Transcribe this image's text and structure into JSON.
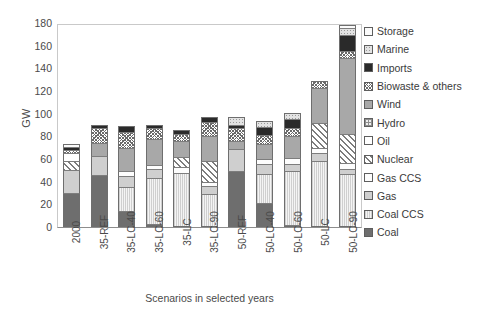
{
  "chart_data": {
    "type": "bar",
    "stacked": true,
    "title": "",
    "xlabel": "Scenarios in selected years",
    "ylabel": "GW",
    "ylim": [
      0,
      180
    ],
    "ytick_step": 20,
    "yticks": [
      180,
      160,
      140,
      120,
      100,
      80,
      60,
      40,
      20,
      0
    ],
    "grid": false,
    "legend_position": "right",
    "categories": [
      "2000",
      "35-REF",
      "35-LC-40",
      "35-LC-60",
      "35-LC",
      "35-LC-90",
      "50-REF",
      "50-LC-40",
      "50-LC-60",
      "50-LC",
      "50-LC-90"
    ],
    "series": [
      {
        "name": "Coal",
        "color": "#6e6e6e",
        "pattern": "solid-dark-grey",
        "values": [
          30,
          46,
          14,
          3,
          0,
          0,
          49,
          21,
          2,
          0,
          0
        ]
      },
      {
        "name": "Coal CCS",
        "color": "#eaeaea",
        "pattern": "light-vertical-stipple",
        "values": [
          0,
          0,
          21,
          40,
          48,
          29,
          0,
          26,
          47,
          58,
          47
        ]
      },
      {
        "name": "Gas",
        "color": "#cfcfcf",
        "pattern": "solid-light-grey",
        "values": [
          20,
          17,
          10,
          8,
          0,
          7,
          20,
          9,
          7,
          7,
          5
        ]
      },
      {
        "name": "Gas CCS",
        "color": "#fdfdfd",
        "pattern": "white-sparse-dots",
        "values": [
          0,
          0,
          4,
          4,
          5,
          4,
          0,
          4,
          5,
          5,
          5
        ]
      },
      {
        "name": "Nuclear",
        "color": "#ffffff",
        "pattern": "diagonal-hatch",
        "values": [
          8,
          0,
          0,
          0,
          9,
          18,
          0,
          0,
          0,
          22,
          26
        ]
      },
      {
        "name": "Oil",
        "color": "#ffffff",
        "pattern": "plain-white",
        "values": [
          7,
          0,
          0,
          0,
          0,
          0,
          0,
          0,
          0,
          0,
          0
        ]
      },
      {
        "name": "Hydro",
        "color": "#efefef",
        "pattern": "light-grid",
        "values": [
          0,
          0,
          0,
          0,
          0,
          0,
          0,
          0,
          0,
          0,
          0
        ]
      },
      {
        "name": "Wind",
        "color": "#a8a8a8",
        "pattern": "solid-medium-grey",
        "values": [
          0,
          11,
          21,
          23,
          14,
          22,
          7,
          13,
          19,
          31,
          68
        ]
      },
      {
        "name": "Biowaste & others",
        "color": "#ffffff",
        "pattern": "fine-cross-hatch",
        "values": [
          3,
          13,
          14,
          9,
          6,
          13,
          11,
          8,
          7,
          6,
          6
        ]
      },
      {
        "name": "Imports",
        "color": "#2a2a2a",
        "pattern": "solid-black",
        "values": [
          3,
          3,
          5,
          3,
          4,
          4,
          3,
          7,
          8,
          0,
          14
        ]
      },
      {
        "name": "Marine",
        "color": "#e3e3e3",
        "pattern": "light-dotted",
        "values": [
          0,
          0,
          0,
          0,
          0,
          0,
          7,
          6,
          6,
          0,
          6
        ]
      },
      {
        "name": "Storage",
        "color": "#fbfbfb",
        "pattern": "white",
        "values": [
          2,
          0,
          0,
          0,
          0,
          0,
          0,
          0,
          0,
          0,
          3
        ]
      }
    ],
    "totals": [
      73,
      90,
      89,
      90,
      86,
      97,
      97,
      94,
      101,
      129,
      180
    ]
  },
  "legend": {
    "items": [
      {
        "label": "Storage",
        "swatch": "p-storage"
      },
      {
        "label": "Marine",
        "swatch": "p-marine"
      },
      {
        "label": "Imports",
        "swatch": "p-imports"
      },
      {
        "label": "Biowaste & others",
        "swatch": "p-biowaste"
      },
      {
        "label": "Wind",
        "swatch": "p-wind"
      },
      {
        "label": "Hydro",
        "swatch": "p-hydro"
      },
      {
        "label": "Oil",
        "swatch": "p-oil"
      },
      {
        "label": "Nuclear",
        "swatch": "p-nuclear"
      },
      {
        "label": "Gas CCS",
        "swatch": "p-gasccs"
      },
      {
        "label": "Gas",
        "swatch": "p-gas"
      },
      {
        "label": "Coal CCS",
        "swatch": "p-coalccs"
      },
      {
        "label": "Coal",
        "swatch": "p-coal"
      }
    ]
  }
}
